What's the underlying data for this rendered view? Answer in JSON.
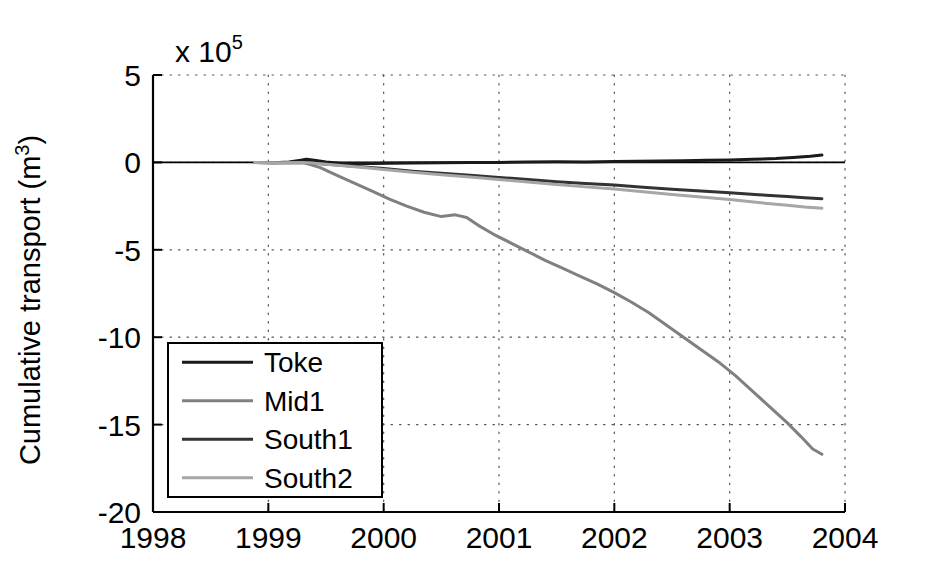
{
  "chart_data": {
    "type": "line",
    "title": "",
    "xlabel": "",
    "ylabel": "Cumulative transport (m",
    "ylabel_sup": "3",
    "ylabel_close": ")",
    "y_exponent_prefix": "x 10",
    "y_exponent_power": "5",
    "xlim": [
      1998,
      2004
    ],
    "ylim": [
      -20,
      5
    ],
    "xticks": [
      "1998",
      "1999",
      "2000",
      "2001",
      "2002",
      "2003",
      "2004"
    ],
    "xtick_values": [
      1998,
      1999,
      2000,
      2001,
      2002,
      2003,
      2004
    ],
    "yticks": [
      "5",
      "0",
      "-5",
      "-10",
      "-15",
      "-20"
    ],
    "ytick_values": [
      5,
      0,
      -5,
      -10,
      -15,
      -20
    ],
    "grid": "dotted",
    "legend_position": "lower-left",
    "legend_entries": [
      "Toke",
      "Mid1",
      "South1",
      "South2"
    ],
    "series": [
      {
        "name": "Toke",
        "color": "#1a1a1a",
        "x": [
          1998.88,
          1999.05,
          1999.18,
          1999.28,
          1999.33,
          1999.4,
          1999.5,
          1999.62,
          1999.75,
          1999.9,
          2000.05,
          2000.25,
          2000.5,
          2000.75,
          2001.0,
          2001.25,
          2001.5,
          2001.75,
          2002.0,
          2002.2,
          2002.4,
          2002.6,
          2002.8,
          2003.0,
          2003.2,
          2003.4,
          2003.55,
          2003.7,
          2003.8
        ],
        "y": [
          0.0,
          -0.02,
          0.02,
          0.12,
          0.18,
          0.12,
          0.02,
          -0.05,
          -0.08,
          -0.06,
          -0.05,
          -0.04,
          -0.02,
          -0.01,
          0.0,
          0.02,
          0.04,
          0.03,
          0.05,
          0.06,
          0.08,
          0.1,
          0.12,
          0.14,
          0.18,
          0.22,
          0.28,
          0.35,
          0.42
        ]
      },
      {
        "name": "Mid1",
        "color": "#808080",
        "x": [
          1998.88,
          1999.1,
          1999.3,
          1999.45,
          1999.6,
          1999.75,
          1999.9,
          2000.05,
          2000.2,
          2000.35,
          2000.5,
          2000.62,
          2000.72,
          2000.82,
          2000.95,
          2001.1,
          2001.25,
          2001.4,
          2001.55,
          2001.7,
          2001.85,
          2002.0,
          2002.15,
          2002.3,
          2002.45,
          2002.6,
          2002.75,
          2002.9,
          2003.05,
          2003.2,
          2003.35,
          2003.5,
          2003.62,
          2003.72,
          2003.8
        ],
        "y": [
          0.0,
          -0.02,
          0.0,
          -0.3,
          -0.75,
          -1.2,
          -1.65,
          -2.1,
          -2.5,
          -2.85,
          -3.1,
          -3.0,
          -3.15,
          -3.6,
          -4.1,
          -4.6,
          -5.1,
          -5.6,
          -6.05,
          -6.5,
          -6.95,
          -7.45,
          -8.0,
          -8.6,
          -9.3,
          -10.0,
          -10.7,
          -11.4,
          -12.2,
          -13.1,
          -14.0,
          -14.9,
          -15.7,
          -16.4,
          -16.7
        ]
      },
      {
        "name": "South1",
        "color": "#333333",
        "x": [
          1998.88,
          1999.1,
          1999.3,
          1999.45,
          1999.6,
          1999.8,
          2000.0,
          2000.25,
          2000.5,
          2000.75,
          2001.0,
          2001.25,
          2001.5,
          2001.75,
          2002.0,
          2002.25,
          2002.5,
          2002.75,
          2003.0,
          2003.25,
          2003.5,
          2003.65,
          2003.8
        ],
        "y": [
          0.0,
          -0.02,
          0.0,
          -0.08,
          -0.15,
          -0.25,
          -0.35,
          -0.5,
          -0.62,
          -0.74,
          -0.86,
          -0.98,
          -1.1,
          -1.2,
          -1.3,
          -1.42,
          -1.54,
          -1.64,
          -1.74,
          -1.85,
          -1.95,
          -2.02,
          -2.08
        ]
      },
      {
        "name": "South2",
        "color": "#a6a6a6",
        "x": [
          1998.88,
          1999.1,
          1999.3,
          1999.45,
          1999.6,
          1999.8,
          2000.0,
          2000.25,
          2000.5,
          2000.75,
          2001.0,
          2001.25,
          2001.5,
          2001.75,
          2002.0,
          2002.25,
          2002.5,
          2002.75,
          2003.0,
          2003.25,
          2003.5,
          2003.65,
          2003.8
        ],
        "y": [
          0.0,
          -0.02,
          0.0,
          -0.08,
          -0.16,
          -0.28,
          -0.4,
          -0.56,
          -0.7,
          -0.84,
          -0.98,
          -1.12,
          -1.26,
          -1.4,
          -1.52,
          -1.68,
          -1.84,
          -1.98,
          -2.12,
          -2.3,
          -2.45,
          -2.55,
          -2.62
        ]
      }
    ]
  },
  "plot_geometry": {
    "left": 153,
    "right": 845,
    "top": 75,
    "bottom": 512
  },
  "legend": {
    "box": {
      "x": 168,
      "y": 343,
      "w": 214,
      "h": 154
    }
  }
}
